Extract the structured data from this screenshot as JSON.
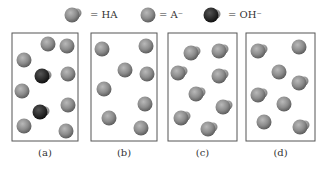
{
  "legend": [
    {
      "species": "HA",
      "label": "= HA",
      "icon": "ha-molecule-icon"
    },
    {
      "species": "A-",
      "label": "= A⁻",
      "icon": "a-minus-ion-icon"
    },
    {
      "species": "OH-",
      "label": "= OH⁻",
      "icon": "oh-minus-ion-icon"
    }
  ],
  "colors": {
    "particle": "#8a8a8a",
    "particle_dark": "#2a2a2a",
    "frame": "#555555"
  },
  "panels": [
    {
      "label": "(a)",
      "particles": {
        "HA": 0,
        "A-": 8,
        "OH-": 2
      }
    },
    {
      "label": "(b)",
      "particles": {
        "HA": 0,
        "A-": 8,
        "OH-": 0
      }
    },
    {
      "label": "(c)",
      "particles": {
        "HA": 8,
        "A-": 0,
        "OH-": 0
      }
    },
    {
      "label": "(d)",
      "particles": {
        "HA": 5,
        "A-": 3,
        "OH-": 0
      }
    }
  ]
}
